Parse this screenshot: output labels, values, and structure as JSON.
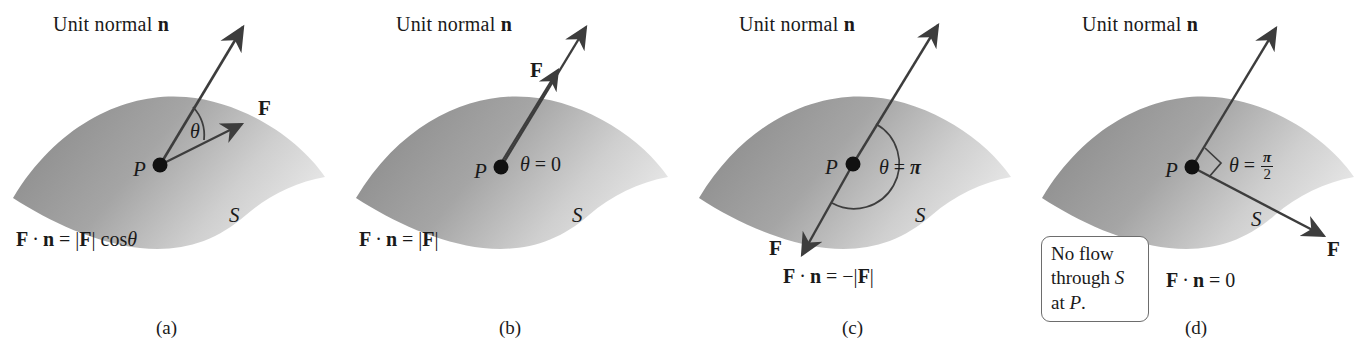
{
  "figure": {
    "kind": "flux-through-surface-diagram",
    "panel_count": 4,
    "surface_label": "S",
    "point_label": "P",
    "normal_title": "Unit normal",
    "normal_symbol": "n",
    "force_symbol": "F",
    "theta_symbol": "θ",
    "colors": {
      "surface_dark": "#8f8f8f",
      "surface_light": "#e9e9e9",
      "ink": "#1a1a1a",
      "arrow": "#3d3d3d",
      "callout_border": "#6d6d6d",
      "background": "#ffffff"
    }
  },
  "panels": [
    {
      "id": "a",
      "caption": "(a)",
      "title": "Unit normal",
      "normal_symbol": "n",
      "force_symbol": "F",
      "point_label": "P",
      "surface_label": "S",
      "angle_label": "θ",
      "angle_value": "",
      "angle_kind": "acute-arc",
      "formula": "F · n = |F| cos θ",
      "formula_parts": {
        "lhs_vec1": "F",
        "dot": "·",
        "lhs_vec2": "n",
        "eq": "=",
        "bar_open": "|",
        "rhs_vec": "F",
        "bar_close": "|",
        "trig": "cos",
        "angle": "θ"
      },
      "description": "F makes an acute angle theta with the unit normal n"
    },
    {
      "id": "b",
      "caption": "(b)",
      "title": "Unit normal",
      "normal_symbol": "n",
      "force_symbol": "F",
      "point_label": "P",
      "surface_label": "S",
      "angle_label": "θ",
      "angle_value": "0",
      "angle_expr": "θ = 0",
      "angle_kind": "zero",
      "formula": "F · n = |F|",
      "formula_parts": {
        "lhs_vec1": "F",
        "dot": "·",
        "lhs_vec2": "n",
        "eq": "=",
        "bar_open": "|",
        "rhs_vec": "F",
        "bar_close": "|",
        "sign": ""
      },
      "description": "F is parallel to n, theta equals zero"
    },
    {
      "id": "c",
      "caption": "(c)",
      "title": "Unit normal",
      "normal_symbol": "n",
      "force_symbol": "F",
      "point_label": "P",
      "surface_label": "S",
      "angle_label": "θ",
      "angle_value": "π",
      "angle_expr": "θ = π",
      "angle_kind": "semicircle-arc",
      "formula": "F · n = −|F|",
      "formula_parts": {
        "lhs_vec1": "F",
        "dot": "·",
        "lhs_vec2": "n",
        "eq": "=",
        "sign": "−",
        "bar_open": "|",
        "rhs_vec": "F",
        "bar_close": "|"
      },
      "description": "F is antiparallel to n, theta equals pi"
    },
    {
      "id": "d",
      "caption": "(d)",
      "title": "Unit normal",
      "normal_symbol": "n",
      "force_symbol": "F",
      "point_label": "P",
      "surface_label": "S",
      "angle_label": "θ",
      "angle_numerator": "π",
      "angle_denominator": "2",
      "angle_eq": "θ =",
      "angle_kind": "right-angle-square",
      "formula": "F · n = 0",
      "formula_parts": {
        "lhs_vec1": "F",
        "dot": "·",
        "lhs_vec2": "n",
        "eq": "=",
        "rhs_value": "0"
      },
      "callout": {
        "line1": "No flow",
        "line2_pre": "through ",
        "line2_em": "S",
        "line3_pre": "at ",
        "line3_em": "P",
        "line3_post": "."
      },
      "description": "F is tangent to the surface, theta equals pi over 2, no flow through S at P"
    }
  ]
}
